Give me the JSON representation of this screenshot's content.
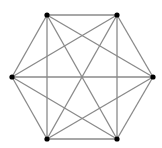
{
  "diagram": {
    "type": "complete-graph",
    "name": "K6",
    "edge_color": "#8a8a8a",
    "node_color": "#000000",
    "background": "#ffffff",
    "nodes": [
      {
        "id": "top-left",
        "x": 47,
        "y": 15
      },
      {
        "id": "top-right",
        "x": 117,
        "y": 15
      },
      {
        "id": "right",
        "x": 153,
        "y": 77
      },
      {
        "id": "bottom-right",
        "x": 117,
        "y": 139
      },
      {
        "id": "bottom-left",
        "x": 47,
        "y": 139
      },
      {
        "id": "left",
        "x": 12,
        "y": 77
      }
    ],
    "edges": [
      [
        0,
        1
      ],
      [
        0,
        2
      ],
      [
        0,
        3
      ],
      [
        0,
        4
      ],
      [
        0,
        5
      ],
      [
        1,
        2
      ],
      [
        1,
        3
      ],
      [
        1,
        4
      ],
      [
        1,
        5
      ],
      [
        2,
        3
      ],
      [
        2,
        4
      ],
      [
        2,
        5
      ],
      [
        3,
        4
      ],
      [
        3,
        5
      ],
      [
        4,
        5
      ]
    ]
  }
}
